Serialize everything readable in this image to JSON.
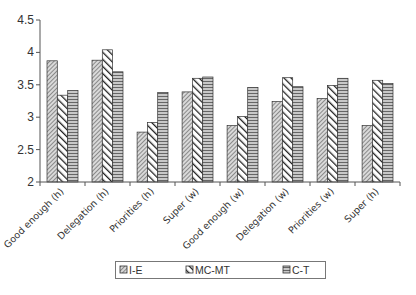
{
  "chart_data": {
    "type": "bar",
    "title": "",
    "xlabel": "",
    "ylabel": "",
    "ylim": [
      2,
      4.5
    ],
    "yticks": [
      2,
      2.5,
      3,
      3.5,
      4,
      4.5
    ],
    "ytick_labels": [
      "2",
      "2.5",
      "3",
      "3.5",
      "4",
      "4.5"
    ],
    "grid": false,
    "legend_position": "bottom",
    "categories": [
      "Good enough (h)",
      "Delegation (h)",
      "Priorities (h)",
      "Super (w)",
      "Good enough (w)",
      "Delegation (w)",
      "Priorities (w)",
      "Super (h)"
    ],
    "series": [
      {
        "name": "I-E",
        "pattern": "diag-fine",
        "values": [
          3.87,
          3.88,
          2.77,
          3.39,
          2.87,
          3.24,
          3.29,
          2.87
        ]
      },
      {
        "name": "MC-MT",
        "pattern": "diag-bold",
        "values": [
          3.34,
          4.04,
          2.92,
          3.6,
          3.01,
          3.61,
          3.49,
          3.57
        ]
      },
      {
        "name": "C-T",
        "pattern": "horizontal",
        "values": [
          3.41,
          3.7,
          3.38,
          3.62,
          3.46,
          3.47,
          3.6,
          3.52
        ]
      }
    ]
  },
  "colors": {
    "axis": "#555555",
    "bar_outline": "#333333",
    "text": "#333333"
  }
}
